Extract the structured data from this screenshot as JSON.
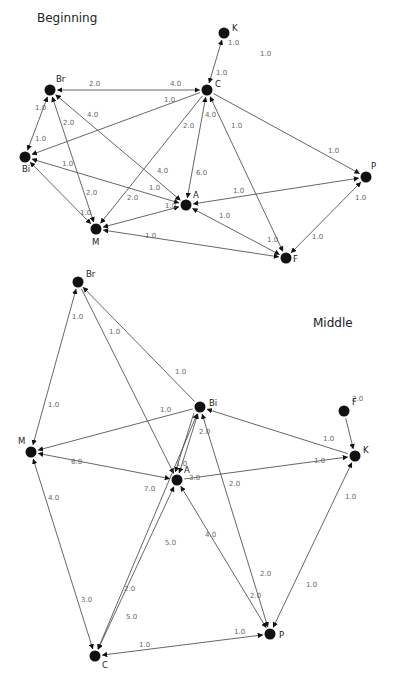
{
  "graphs": [
    {
      "title": "Beginning",
      "title_pos": [
        37,
        19
      ],
      "nodes": [
        {
          "id": "K",
          "x": 224,
          "y": 33,
          "lx": 8,
          "ly": -2
        },
        {
          "id": "C",
          "x": 207,
          "y": 90,
          "lx": 8,
          "ly": -3
        },
        {
          "id": "Br",
          "x": 50,
          "y": 90,
          "lx": 6,
          "ly": -8
        },
        {
          "id": "Bi",
          "x": 25,
          "y": 157,
          "lx": -3,
          "ly": 15
        },
        {
          "id": "A",
          "x": 186,
          "y": 205,
          "lx": 7,
          "ly": -7
        },
        {
          "id": "M",
          "x": 96,
          "y": 229,
          "lx": -4,
          "ly": 16
        },
        {
          "id": "P",
          "x": 366,
          "y": 177,
          "lx": 5,
          "ly": -8
        },
        {
          "id": "F",
          "x": 286,
          "y": 258,
          "lx": 7,
          "ly": 4
        }
      ],
      "edges": [
        {
          "from": "K",
          "to": "C",
          "bidir": true,
          "labels": [
            {
              "t": "1.0",
              "x": 228,
              "y": 45
            },
            {
              "t": "1.0",
              "x": 216,
              "y": 75
            }
          ]
        },
        {
          "from": "C",
          "to": "Br",
          "bidir": true,
          "labels": [
            {
              "t": "2.0",
              "x": 89,
              "y": 86
            },
            {
              "t": "4.0",
              "x": 170,
              "y": 86
            }
          ]
        },
        {
          "from": "C",
          "to": "Bi",
          "bidir": false,
          "labels": [
            {
              "t": "1.0",
              "x": 164,
              "y": 102
            }
          ]
        },
        {
          "from": "C",
          "to": "M",
          "bidir": false,
          "labels": [
            {
              "t": "2.0",
              "x": 183,
              "y": 128
            }
          ]
        },
        {
          "from": "C",
          "to": "A",
          "bidir": true,
          "labels": [
            {
              "t": "4.0",
              "x": 205,
              "y": 117
            },
            {
              "t": "6.0",
              "x": 196,
              "y": 175
            }
          ]
        },
        {
          "from": "C",
          "to": "F",
          "bidir": true,
          "labels": [
            {
              "t": "1.0",
              "x": 231,
              "y": 128
            },
            {
              "t": "1.0",
              "x": 267,
              "y": 242
            }
          ]
        },
        {
          "from": "C",
          "to": "P",
          "bidir": false,
          "labels": [
            {
              "t": "1.0",
              "x": 328,
              "y": 153
            }
          ]
        },
        {
          "from": "Br",
          "to": "Bi",
          "bidir": true,
          "labels": [
            {
              "t": "1.0",
              "x": 35,
              "y": 110
            },
            {
              "t": "1.0",
              "x": 35,
              "y": 141
            }
          ]
        },
        {
          "from": "Br",
          "to": "M",
          "bidir": true,
          "labels": [
            {
              "t": "2.0",
              "x": 63,
              "y": 125
            },
            {
              "t": "2.0",
              "x": 86,
              "y": 195
            }
          ]
        },
        {
          "from": "Br",
          "to": "A",
          "bidir": true,
          "labels": [
            {
              "t": "4.0",
              "x": 87,
              "y": 117
            },
            {
              "t": "4.0",
              "x": 157,
              "y": 173
            }
          ]
        },
        {
          "from": "Bi",
          "to": "A",
          "bidir": true,
          "labels": [
            {
              "t": "1.0",
              "x": 62,
              "y": 166
            },
            {
              "t": "1.0",
              "x": 149,
              "y": 190
            }
          ]
        },
        {
          "from": "Bi",
          "to": "M",
          "bidir": true,
          "labels": [
            {
              "t": "1.0",
              "x": 80,
              "y": 215
            }
          ]
        },
        {
          "from": "M",
          "to": "A",
          "bidir": true,
          "labels": [
            {
              "t": "2.0",
              "x": 127,
              "y": 200
            },
            {
              "t": "1.0",
              "x": 165,
              "y": 208
            }
          ]
        },
        {
          "from": "M",
          "to": "F",
          "bidir": true,
          "labels": [
            {
              "t": "1.0",
              "x": 145,
              "y": 238
            }
          ]
        },
        {
          "from": "A",
          "to": "P",
          "bidir": true,
          "labels": [
            {
              "t": "1.0",
              "x": 233,
              "y": 193
            }
          ]
        },
        {
          "from": "A",
          "to": "F",
          "bidir": true,
          "labels": [
            {
              "t": "1.0",
              "x": 219,
              "y": 218
            }
          ]
        },
        {
          "from": "P",
          "to": "F",
          "bidir": true,
          "labels": [
            {
              "t": "1.0",
              "x": 355,
              "y": 200
            },
            {
              "t": "1.0",
              "x": 312,
              "y": 239
            }
          ]
        }
      ],
      "free_labels": [
        {
          "t": "1.0",
          "x": 260,
          "y": 56
        }
      ]
    },
    {
      "title": "Middle",
      "title_pos": [
        313,
        324
      ],
      "nodes": [
        {
          "id": "Br",
          "x": 78,
          "y": 282,
          "lx": 8,
          "ly": -5
        },
        {
          "id": "Bi",
          "x": 200,
          "y": 407,
          "lx": 9,
          "ly": -1
        },
        {
          "id": "M",
          "x": 31,
          "y": 452,
          "lx": -13,
          "ly": -8
        },
        {
          "id": "A",
          "x": 177,
          "y": 480,
          "lx": 7,
          "ly": -7
        },
        {
          "id": "K",
          "x": 355,
          "y": 456,
          "lx": 8,
          "ly": -3
        },
        {
          "id": "F",
          "x": 344,
          "y": 411,
          "lx": 8,
          "ly": -6
        },
        {
          "id": "C",
          "x": 95,
          "y": 656,
          "lx": 7,
          "ly": 12
        },
        {
          "id": "P",
          "x": 270,
          "y": 634,
          "lx": 9,
          "ly": 4
        }
      ],
      "edges": [
        {
          "from": "Br",
          "to": "M",
          "bidir": true,
          "labels": [
            {
              "t": "1.0",
              "x": 72,
              "y": 319
            },
            {
              "t": "1.0",
              "x": 48,
              "y": 407
            }
          ]
        },
        {
          "from": "Br",
          "to": "A",
          "bidir": false,
          "labels": [
            {
              "t": "1.0",
              "x": 109,
              "y": 334
            }
          ]
        },
        {
          "from": "Bi",
          "to": "Br",
          "bidir": false,
          "labels": [
            {
              "t": "1.0",
              "x": 175,
              "y": 374
            }
          ]
        },
        {
          "from": "Bi",
          "to": "M",
          "bidir": false,
          "labels": [
            {
              "t": "1.0",
              "x": 160,
              "y": 412
            }
          ]
        },
        {
          "from": "M",
          "to": "A",
          "bidir": true,
          "labels": [
            {
              "t": "6.0",
              "x": 71,
              "y": 464
            },
            {
              "t": "7.0",
              "x": 144,
              "y": 491
            }
          ]
        },
        {
          "from": "M",
          "to": "C",
          "bidir": true,
          "labels": [
            {
              "t": "4.0",
              "x": 48,
              "y": 500
            },
            {
              "t": "3.0",
              "x": 81,
              "y": 602
            }
          ]
        },
        {
          "from": "A",
          "to": "Bi",
          "bidir": true,
          "labels": [
            {
              "t": "1.0",
              "x": 176,
              "y": 466
            },
            {
              "t": "3.0",
              "x": 189,
              "y": 480
            }
          ]
        },
        {
          "from": "Bi",
          "to": "A",
          "bidir": false,
          "labels": [
            {
              "t": "2.0",
              "x": 199,
              "y": 434
            }
          ],
          "offset": 4
        },
        {
          "from": "K",
          "to": "Bi",
          "bidir": false,
          "labels": [
            {
              "t": "1.0",
              "x": 323,
              "y": 441
            }
          ]
        },
        {
          "from": "A",
          "to": "K",
          "bidir": false,
          "labels": [
            {
              "t": "1.0",
              "x": 314,
              "y": 463
            }
          ]
        },
        {
          "from": "F",
          "to": "K",
          "bidir": false,
          "labels": [
            {
              "t": "2.0",
              "x": 352,
              "y": 401
            }
          ]
        },
        {
          "from": "C",
          "to": "Bi",
          "bidir": true,
          "labels": [
            {
              "t": "2.0",
              "x": 124,
              "y": 591
            }
          ]
        },
        {
          "from": "C",
          "to": "A",
          "bidir": true,
          "labels": [
            {
              "t": "5.0",
              "x": 165,
              "y": 545
            },
            {
              "t": "5.0",
              "x": 126,
              "y": 619
            }
          ]
        },
        {
          "from": "Bi",
          "to": "P",
          "bidir": true,
          "labels": [
            {
              "t": "2.0",
              "x": 229,
              "y": 486
            },
            {
              "t": "2.0",
              "x": 260,
              "y": 576
            }
          ]
        },
        {
          "from": "P",
          "to": "A",
          "bidir": true,
          "labels": [
            {
              "t": "4.0",
              "x": 205,
              "y": 537
            },
            {
              "t": "2.0",
              "x": 250,
              "y": 598
            }
          ]
        },
        {
          "from": "P",
          "to": "K",
          "bidir": true,
          "labels": [
            {
              "t": "1.0",
              "x": 345,
              "y": 499
            },
            {
              "t": "1.0",
              "x": 306,
              "y": 587
            }
          ]
        },
        {
          "from": "C",
          "to": "P",
          "bidir": true,
          "labels": [
            {
              "t": "1.0",
              "x": 139,
              "y": 647
            },
            {
              "t": "1.0",
              "x": 234,
              "y": 634
            }
          ]
        }
      ],
      "free_labels": []
    }
  ]
}
